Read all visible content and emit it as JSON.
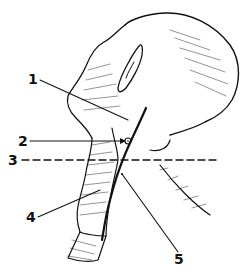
{
  "figure": {
    "labels": [
      {
        "id": "1",
        "text": "1"
      },
      {
        "id": "2",
        "text": "2"
      },
      {
        "id": "3",
        "text": "3"
      },
      {
        "id": "4",
        "text": "4"
      },
      {
        "id": "5",
        "text": "5"
      }
    ],
    "colors": {
      "ink": "#111111",
      "background": "#ffffff"
    }
  }
}
